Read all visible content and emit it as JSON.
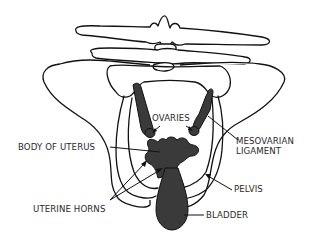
{
  "diagram": {
    "labels": {
      "ovaries": "OVARIES",
      "body_of_uterus": "BODY OF UTERUS",
      "uterine_horns": "UTERINE HORNS",
      "mesovarian_line1": "MESOVARIAN",
      "mesovarian_line2": "LIGAMENT",
      "pelvis": "PELVIS",
      "bladder": "BLADDER"
    },
    "colors": {
      "background": "#ffffff",
      "line": "#111111",
      "organ_fill": "#3a3a3a",
      "label_text": "#2a2a2a"
    }
  }
}
